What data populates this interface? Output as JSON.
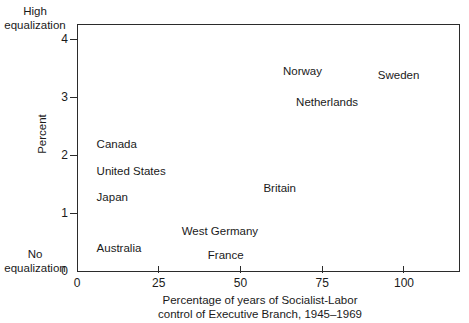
{
  "chart_data": {
    "type": "scatter",
    "title": "",
    "xlabel": "Percentage of years of Socialist-Labor control of Executive Branch, 1945-1969",
    "ylabel": "Percent",
    "xlim": [
      0,
      117
    ],
    "ylim": [
      0,
      4.28
    ],
    "grid": false,
    "legend": null,
    "x_ticks": [
      {
        "value": 0,
        "label": "0"
      },
      {
        "value": 25,
        "label": "25"
      },
      {
        "value": 50,
        "label": "50"
      },
      {
        "value": 75,
        "label": "75"
      },
      {
        "value": 100,
        "label": "100"
      }
    ],
    "y_ticks": [
      {
        "value": 0,
        "label": "0"
      },
      {
        "value": 1,
        "label": "1"
      },
      {
        "value": 2,
        "label": "2"
      },
      {
        "value": 3,
        "label": "3"
      },
      {
        "value": 4,
        "label": "4"
      }
    ],
    "y_axis_top_caption": "High equalization",
    "y_axis_bottom_caption": "No equalization",
    "points": [
      {
        "name": "Canada",
        "x": 6,
        "y": 2.2
      },
      {
        "name": "United States",
        "x": 6,
        "y": 1.75
      },
      {
        "name": "Japan",
        "x": 6,
        "y": 1.3
      },
      {
        "name": "Australia",
        "x": 6,
        "y": 0.42
      },
      {
        "name": "West Germany",
        "x": 32,
        "y": 0.71
      },
      {
        "name": "France",
        "x": 40,
        "y": 0.3
      },
      {
        "name": "Britain",
        "x": 57,
        "y": 1.45
      },
      {
        "name": "Norway",
        "x": 63,
        "y": 3.47
      },
      {
        "name": "Netherlands",
        "x": 67,
        "y": 2.93
      },
      {
        "name": "Sweden",
        "x": 92,
        "y": 3.4
      }
    ]
  },
  "axis_titles": {
    "y": "Percent",
    "x_line1": "Percentage of years of Socialist-Labor",
    "x_line2": "control of Executive Branch, 1945–1969"
  },
  "captions": {
    "high_line1": "High",
    "high_line2": "equalization",
    "no_line1": "No",
    "no_line2": "equalization"
  }
}
